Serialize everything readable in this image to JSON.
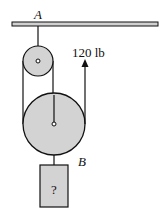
{
  "diagram": {
    "type": "pulley-system",
    "labels": {
      "support_point": "A",
      "hook_point": "B",
      "applied_force": "120 lb",
      "unknown_weight": "?"
    },
    "colors": {
      "pulley_fill": "#d3d3d3",
      "block_fill": "#d3d3d3",
      "ceiling_fill": "#d0d0d0",
      "stroke": "#111111"
    },
    "components": [
      {
        "id": "ceiling",
        "description": "Fixed horizontal support beam"
      },
      {
        "id": "small-pulley",
        "description": "Fixed pulley hung from point A"
      },
      {
        "id": "large-pulley",
        "description": "Movable pulley with load hook B"
      },
      {
        "id": "block",
        "description": "Hanging weight of unknown magnitude"
      },
      {
        "id": "force-arrow",
        "description": "Upward pull on free rope end"
      }
    ]
  }
}
